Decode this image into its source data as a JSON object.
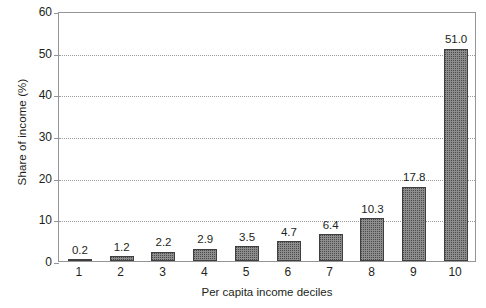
{
  "chart_data": {
    "type": "bar",
    "title": "",
    "subtitle": "",
    "xlabel": "Per capita income deciles",
    "ylabel": "Share of income (%)",
    "categories": [
      "1",
      "2",
      "3",
      "4",
      "5",
      "6",
      "7",
      "8",
      "9",
      "10"
    ],
    "values": [
      0.2,
      1.2,
      2.2,
      2.9,
      3.5,
      4.7,
      6.4,
      10.3,
      17.8,
      51.0
    ],
    "data_labels": [
      "0.2",
      "1.2",
      "2.2",
      "2.9",
      "3.5",
      "4.7",
      "6.4",
      "10.3",
      "17.8",
      "51.0"
    ],
    "ylim": [
      0,
      60
    ],
    "yticks": [
      0,
      10,
      20,
      30,
      40,
      50,
      60
    ],
    "ytick_labels": [
      "0",
      "10",
      "20",
      "30",
      "40",
      "50",
      "60"
    ],
    "grid": true,
    "grid_axis": "y",
    "grid_style": "dotted",
    "legend": null,
    "legend_position": "none",
    "bar_fill": "#8d8d8d",
    "bar_edge": "#3f3f3f",
    "bar_pattern": "stipple",
    "axis_color": "#939598",
    "text_color": "#231f20",
    "background": "#ffffff"
  }
}
